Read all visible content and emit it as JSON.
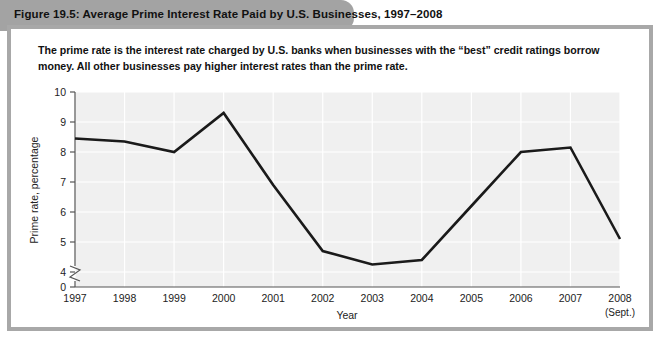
{
  "figure": {
    "title": "Figure 19.5: Average Prime Interest Rate Paid by U.S. Businesses, 1997–2008",
    "caption": "The prime rate is the interest rate charged by U.S. banks when businesses with the “best” credit ratings borrow money. All other businesses pay higher interest rates than the prime rate.",
    "title_bar_color": "#a3a3a3",
    "frame_color": "#a8a8a8",
    "plot_background_color": "#f0f0f0",
    "line_color": "#1a1a1a",
    "gridline_color": "#ffffff"
  },
  "chart_data": {
    "type": "line",
    "title": "Average Prime Interest Rate Paid by U.S. Businesses, 1997–2008",
    "xlabel": "Year",
    "ylabel": "Prime rate, percentage",
    "x_tick_labels": [
      "1997",
      "1998",
      "1999",
      "2000",
      "2001",
      "2002",
      "2003",
      "2004",
      "2005",
      "2006",
      "2007",
      "2008"
    ],
    "x_tick_sublabels": [
      "",
      "",
      "",
      "",
      "",
      "",
      "",
      "",
      "",
      "",
      "",
      "(Sept.)"
    ],
    "categories": [
      1997,
      1998,
      1999,
      2000,
      2001,
      2002,
      2003,
      2004,
      2005,
      2006,
      2007,
      2008
    ],
    "values": [
      8.45,
      8.35,
      8.0,
      9.3,
      6.9,
      4.7,
      4.25,
      4.4,
      6.2,
      8.0,
      8.15,
      5.1
    ],
    "y_tick_labels": [
      "0",
      "4",
      "5",
      "6",
      "7",
      "8",
      "9",
      "10"
    ],
    "y_ticks": [
      0,
      4,
      5,
      6,
      7,
      8,
      9,
      10
    ],
    "ylim": [
      4,
      10
    ],
    "y_axis_break": true,
    "grid": true,
    "legend": null,
    "series": [
      {
        "name": "Prime rate, percentage",
        "values": [
          8.45,
          8.35,
          8.0,
          9.3,
          6.9,
          4.7,
          4.25,
          4.4,
          6.2,
          8.0,
          8.15,
          5.1
        ]
      }
    ]
  }
}
